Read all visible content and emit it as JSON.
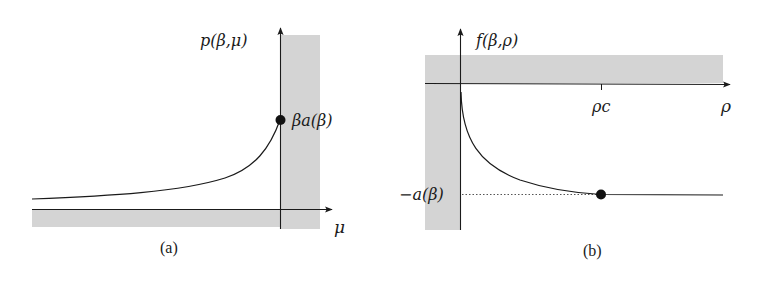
{
  "colors": {
    "shade": "#d4d4d4",
    "ink": "#1a1a1a",
    "background": "#ffffff"
  },
  "panel_a": {
    "caption": "(a)",
    "y_axis_label": "p(β,μ)",
    "x_axis_label": "μ",
    "point_label": "βa(β)",
    "description": "Increasing convex curve approaching the point βa(β) on the vertical axis at μ = 0; shaded regions along the vertical axis (μ ≥ 0) and below the horizontal axis (p ≤ 0)."
  },
  "panel_b": {
    "caption": "(b)",
    "y_axis_label": "f(β,ρ)",
    "x_axis_label": "ρ",
    "tick_label": "ρc",
    "level_label": "−a(β)",
    "description": "Decreasing curve starting at the origin, reaching −a(β) at ρc (marked dot) and then constant; dotted guide line at −a(β); shaded regions above the horizontal axis (f ≥ 0) and left of the vertical axis (ρ ≤ 0)."
  }
}
